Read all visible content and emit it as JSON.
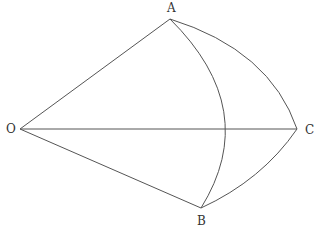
{
  "diagram": {
    "type": "geometric-figure",
    "points": {
      "O": {
        "label": "O",
        "x": 20,
        "y": 129
      },
      "A": {
        "label": "A",
        "x": 170,
        "y": 19
      },
      "B": {
        "label": "B",
        "x": 201,
        "y": 208
      },
      "C": {
        "label": "C",
        "x": 297,
        "y": 129
      }
    },
    "segments": [
      {
        "from": "O",
        "to": "A"
      },
      {
        "from": "O",
        "to": "B"
      },
      {
        "from": "O",
        "to": "C"
      }
    ],
    "arcs": [
      {
        "from": "A",
        "to": "B",
        "note": "arc bulging right, crosses OC near x=224"
      },
      {
        "from": "A",
        "to": "C",
        "note": "outer arc bulging up-right"
      },
      {
        "from": "C",
        "to": "B",
        "note": "arc bulging down-right"
      }
    ],
    "stroke_color": "#555555",
    "label_color": "#333333"
  }
}
